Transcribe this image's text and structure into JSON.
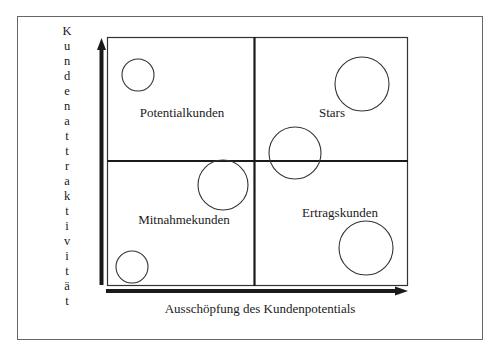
{
  "diagram": {
    "type": "portfolio-matrix",
    "x_axis_label": "Ausschöpfung des Kundenpotentials",
    "y_axis_label": "Kundenattraktivität",
    "y_axis_letters": [
      "K",
      "u",
      "n",
      "d",
      "e",
      "n",
      "a",
      "t",
      "t",
      "r",
      "a",
      "k",
      "t",
      "i",
      "v",
      "i",
      "t",
      "ä",
      "t"
    ],
    "quadrants": [
      {
        "position": "top-left",
        "label": "Potentialkunden"
      },
      {
        "position": "top-right",
        "label": "Stars"
      },
      {
        "position": "bottom-left",
        "label": "Mitnahmekunden"
      },
      {
        "position": "bottom-right",
        "label": "Ertragskunden"
      }
    ],
    "circles": [
      {
        "quadrant": "top-left",
        "cx": 138,
        "cy": 75,
        "r": 16
      },
      {
        "quadrant": "top-right",
        "cx": 362,
        "cy": 84,
        "r": 27
      },
      {
        "quadrant": "top-right",
        "cx": 295,
        "cy": 153,
        "r": 26
      },
      {
        "quadrant": "bottom-left",
        "cx": 223,
        "cy": 185,
        "r": 25
      },
      {
        "quadrant": "bottom-left",
        "cx": 132,
        "cy": 267,
        "r": 16
      },
      {
        "quadrant": "bottom-right",
        "cx": 366,
        "cy": 248,
        "r": 27
      }
    ],
    "colors": {
      "line": "#1a1a1a",
      "frame": "#555555",
      "background": "#ffffff"
    }
  }
}
